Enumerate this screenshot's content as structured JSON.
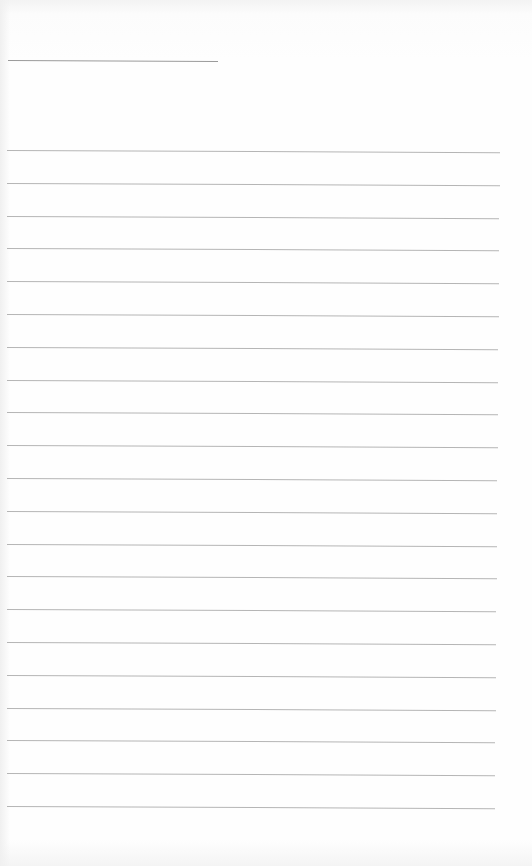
{
  "page": {
    "type": "lined-notepad",
    "background_color": "#fefefe",
    "line_color": "#b5b5b5",
    "title_line": {
      "text": "",
      "x": 8,
      "y": 60,
      "width": 210
    },
    "ruled_lines": {
      "count": 21,
      "first_y": 150,
      "spacing": 32.8,
      "lines": [
        {
          "text": ""
        },
        {
          "text": ""
        },
        {
          "text": ""
        },
        {
          "text": ""
        },
        {
          "text": ""
        },
        {
          "text": ""
        },
        {
          "text": ""
        },
        {
          "text": ""
        },
        {
          "text": ""
        },
        {
          "text": ""
        },
        {
          "text": ""
        },
        {
          "text": ""
        },
        {
          "text": ""
        },
        {
          "text": ""
        },
        {
          "text": ""
        },
        {
          "text": ""
        },
        {
          "text": ""
        },
        {
          "text": ""
        },
        {
          "text": ""
        },
        {
          "text": ""
        },
        {
          "text": ""
        }
      ]
    }
  }
}
